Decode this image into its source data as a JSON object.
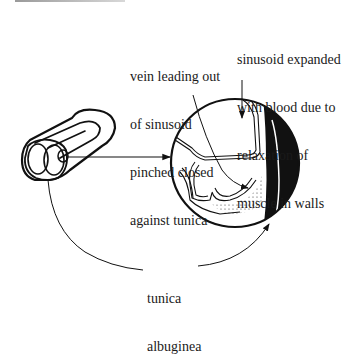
{
  "labels": {
    "vein": {
      "lines": [
        "vein leading out",
        "of sinusoid",
        "pinched closed",
        "against tunica"
      ]
    },
    "sinusoid": {
      "lines": [
        "sinusoid expanded",
        "with blood due to",
        "relaxation of",
        "muscle in walls"
      ]
    },
    "tunica": {
      "lines": [
        "tunica",
        "albuginea"
      ]
    }
  },
  "colors": {
    "ink": "#111111",
    "background": "#ffffff"
  }
}
